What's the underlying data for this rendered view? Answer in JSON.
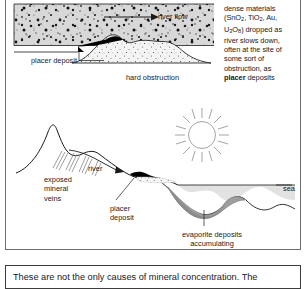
{
  "figure": {
    "top_diagram": {
      "labels": {
        "river_flow": "river flow",
        "placer_deposit": "placer deposit",
        "hard_obstruction": "hard obstruction"
      },
      "caption_lines": [
        "dense materials",
        "(SnO2, TiO2, Au,",
        "U3O8) dropped as",
        "river slows down,",
        "often at the site of",
        "some sort of",
        "obstruction, as",
        "placer deposits"
      ],
      "caption_bold_word": "placer",
      "caption_tail": " deposits",
      "minerals": [
        "SnO2",
        "TiO2",
        "Au",
        "U3O8"
      ]
    },
    "bottom_diagram": {
      "labels": {
        "exposed_mineral_veins": "exposed\nmineral\nveins",
        "river": "river",
        "placer_deposit": "placer\ndeposit",
        "evaporite": "evaporite deposits\naccumulating",
        "sea": "sea"
      },
      "sun_icon": "sun-icon"
    },
    "colors": {
      "water_fill": "#d9d9d9",
      "sea_fill": "#e0e0e0",
      "evaporite_fill": "#9a9a9a",
      "obstruction_fill": "#efefef",
      "placer_fill": "#000000",
      "line": "#1a1a1a",
      "frame": "#6e6e6e"
    }
  },
  "note": {
    "text": "These are not the only causes of mineral concentration.  The"
  }
}
